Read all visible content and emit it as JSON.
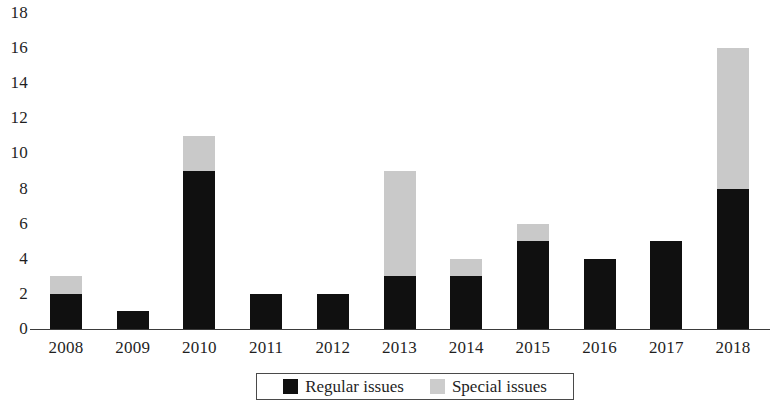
{
  "chart_data": {
    "type": "bar",
    "subtype": "stacked-vertical",
    "title": "",
    "subtitle": "",
    "xlabel": "",
    "ylabel": "",
    "categories": [
      "2008",
      "2009",
      "2010",
      "2011",
      "2012",
      "2013",
      "2014",
      "2015",
      "2016",
      "2017",
      "2018"
    ],
    "series": [
      {
        "name": "Regular issues",
        "color": "#101010",
        "values": [
          2,
          1,
          9,
          2,
          2,
          3,
          3,
          5,
          4,
          5,
          8
        ]
      },
      {
        "name": "Special issues",
        "color": "#c9c9c9",
        "values": [
          1,
          0,
          2,
          0,
          0,
          6,
          1,
          1,
          0,
          0,
          8
        ]
      }
    ],
    "totals": [
      3,
      1,
      11,
      2,
      2,
      9,
      4,
      6,
      4,
      5,
      16
    ],
    "ylim": [
      0,
      18
    ],
    "ytick_step": 2,
    "y_tick_labels": [
      "0",
      "2",
      "4",
      "6",
      "8",
      "10",
      "12",
      "14",
      "16",
      "18"
    ],
    "grid": false,
    "legend_position": "bottom-center",
    "legend_entries": [
      "Regular issues",
      "Special issues"
    ]
  },
  "legend": {
    "regular": {
      "label": "Regular issues",
      "swatch_name": "legend-swatch-regular",
      "color": "#101010"
    },
    "special": {
      "label": "Special issues",
      "swatch_name": "legend-swatch-special",
      "color": "#c9c9c9"
    }
  }
}
